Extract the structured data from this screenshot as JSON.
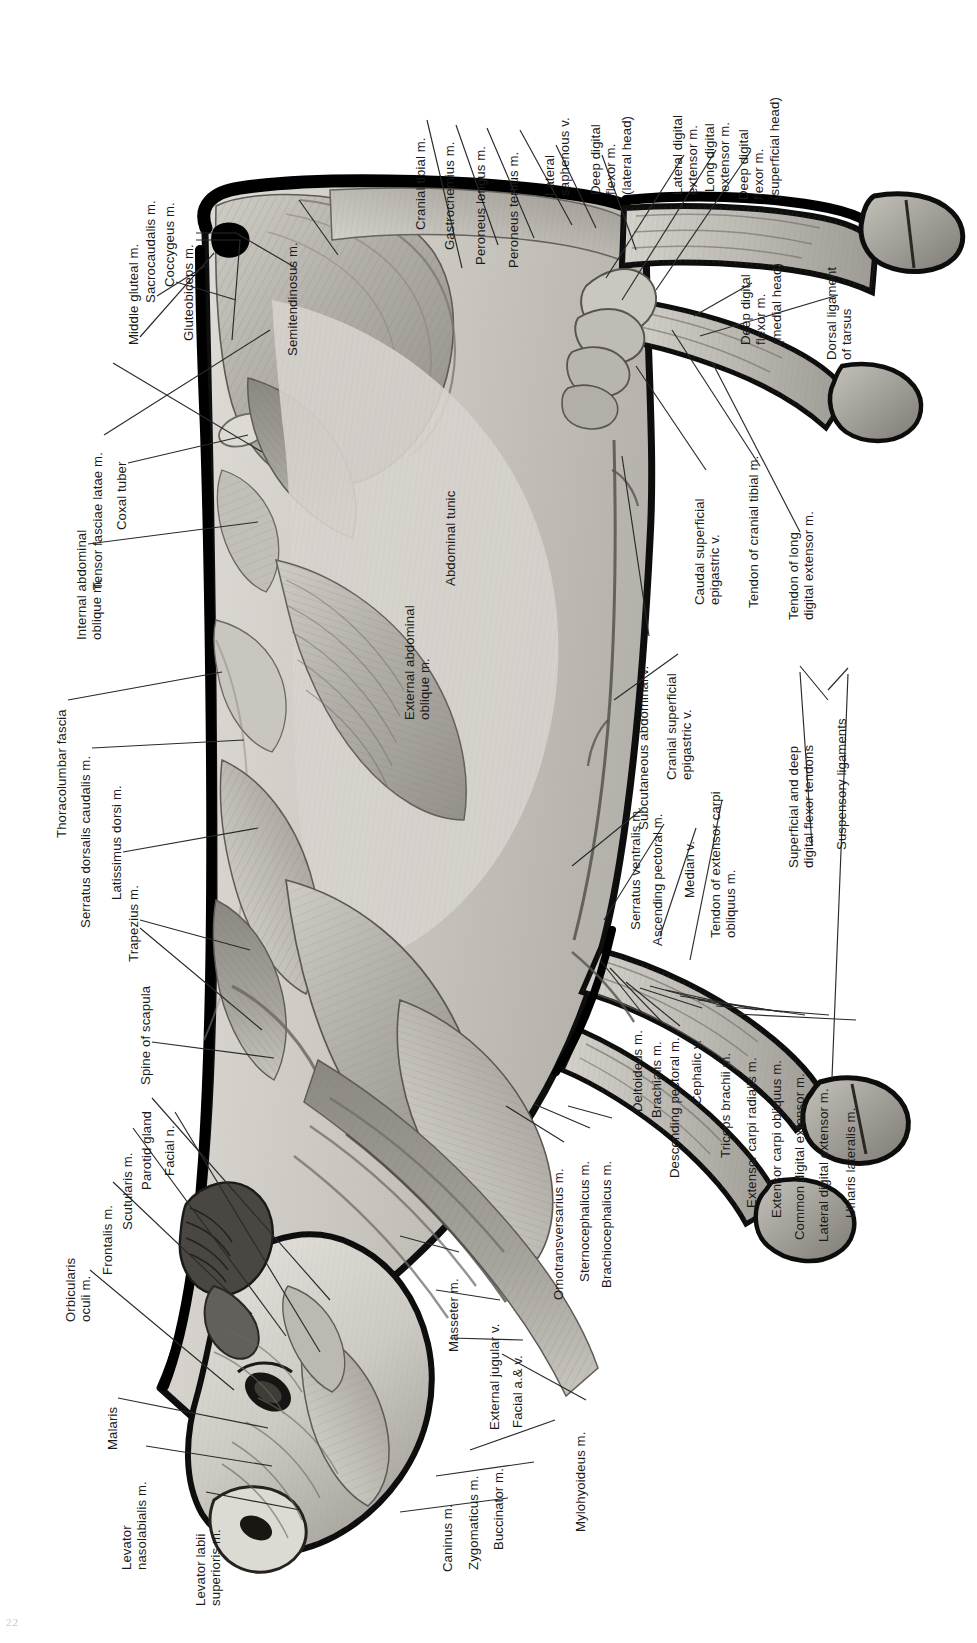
{
  "figure": {
    "orientation": "rotated-90",
    "page_number": "22",
    "palette": {
      "ink": "#1a1a1a",
      "leader": "#2a2a2a",
      "outline": "#0d0d0d",
      "muscle_light": "#d9d6d1",
      "muscle_mid": "#b3afa9",
      "muscle_dark": "#8d8983",
      "muscle_deep": "#6e6a65",
      "paper": "#ffffff"
    }
  },
  "labels": {
    "hindquarter": [
      {
        "id": "middle-gluteal",
        "text": "Middle gluteal m."
      },
      {
        "id": "sacrocaudalis",
        "text": "Sacrocaudalis m."
      },
      {
        "id": "coccygeus",
        "text": "Coccygeus m."
      },
      {
        "id": "gluteobiceps",
        "text": "Gluteobiceps m."
      },
      {
        "id": "semitendinosus",
        "text": "Semitendinosus m."
      },
      {
        "id": "tensor-fasciae-latae",
        "text": "Tensor fasciae latae m."
      },
      {
        "id": "coxal-tuber",
        "text": "Coxal tuber"
      },
      {
        "id": "internal-abdominal-oblique",
        "text": "Internal abdominal\noblique m."
      }
    ],
    "hindlimb": [
      {
        "id": "cranial-tibial",
        "text": "Cranial tibial m."
      },
      {
        "id": "gastrocnemius",
        "text": "Gastrocnemius m."
      },
      {
        "id": "peroneus-longus",
        "text": "Peroneus longus m."
      },
      {
        "id": "peroneus-tertius",
        "text": "Peroneus tertius m."
      },
      {
        "id": "lateral-saphenous-v",
        "text": "Lateral\nsaphenous v."
      },
      {
        "id": "deep-digital-flexor-lateral",
        "text": "Deep digital\nflexor m.\n(lateral head)"
      },
      {
        "id": "lateral-digital-extensor",
        "text": "Lateral digital\nextensor m."
      },
      {
        "id": "long-digital-extensor",
        "text": "Long digital\nextensor m."
      },
      {
        "id": "deep-digital-flexor-superficial",
        "text": "Deep digital\nflexor m.\n(superficial head)"
      },
      {
        "id": "deep-digital-flexor-medial",
        "text": "Deep digital\nflexor m.\n(medial head)"
      },
      {
        "id": "dorsal-ligament-tarsus",
        "text": "Dorsal ligament\nof tarsus"
      },
      {
        "id": "tendon-cranial-tibial",
        "text": "Tendon of cranial tibial m."
      },
      {
        "id": "tendon-long-digital-extensor",
        "text": "Tendon of long\ndigital extensor m."
      }
    ],
    "trunk": [
      {
        "id": "thoracolumbar-fascia",
        "text": "Thoracolumbar fascia"
      },
      {
        "id": "serratus-dorsalis-caudalis",
        "text": "Serratus dorsalis caudalis m."
      },
      {
        "id": "latissimus-dorsi",
        "text": "Latissimus dorsi m."
      },
      {
        "id": "trapezius",
        "text": "Trapezius m."
      },
      {
        "id": "spine-of-scapula",
        "text": "Spine of scapula"
      },
      {
        "id": "abdominal-tunic",
        "text": "Abdominal tunic"
      },
      {
        "id": "external-abdominal-oblique",
        "text": "External abdominal\noblique m."
      }
    ],
    "ventral": [
      {
        "id": "subcutaneous-abdominal-v",
        "text": "Subcutaneous abdominal v."
      },
      {
        "id": "cranial-superficial-epigastric-v",
        "text": "Cranial superficial\nepigastric v."
      },
      {
        "id": "caudal-superficial-epigastric-v",
        "text": "Caudal superficial\nepigastric v."
      },
      {
        "id": "serratus-ventralis",
        "text": "Serratus ventralis m."
      },
      {
        "id": "ascending-pectoral",
        "text": "Ascending pectoral m."
      },
      {
        "id": "median-v",
        "text": "Median v."
      },
      {
        "id": "tendon-extensor-carpi-obliquus",
        "text": "Tendon of extensor carpi\nobliquus m."
      },
      {
        "id": "superficial-deep-digital-flexor-tendons",
        "text": "Superficial and deep\ndigital flexor tendons"
      },
      {
        "id": "suspensory-ligaments",
        "text": "Suspensory ligaments"
      }
    ],
    "forelimb": [
      {
        "id": "deltoideus",
        "text": "Deltoideus m."
      },
      {
        "id": "brachialis",
        "text": "Brachialis m."
      },
      {
        "id": "descending-pectoral",
        "text": "Descending pectoral m."
      },
      {
        "id": "cephalic-v",
        "text": "Cephalic v."
      },
      {
        "id": "triceps-brachii",
        "text": "Triceps brachii m."
      },
      {
        "id": "extensor-carpi-radialis",
        "text": "Extensor carpi radialis m."
      },
      {
        "id": "extensor-carpi-obliquus",
        "text": "Extensor carpi obliquus m."
      },
      {
        "id": "common-digital-extensor",
        "text": "Common digital extensor m."
      },
      {
        "id": "lateral-digital-extensor-fore",
        "text": "Lateral digital extensor m."
      },
      {
        "id": "ulnaris-lateralis",
        "text": "Ulnaris lateralis m."
      }
    ],
    "neck": [
      {
        "id": "brachiocephalicus",
        "text": "Brachiocephalicus m."
      },
      {
        "id": "sternocephalicus",
        "text": "Sternocephalicus m."
      },
      {
        "id": "omotransversarius",
        "text": "Omotransversarius m."
      },
      {
        "id": "mylohyoideus",
        "text": "Mylohyoideus m."
      },
      {
        "id": "facial-a-v",
        "text": "Facial a.& v."
      },
      {
        "id": "external-jugular-v",
        "text": "External jugular v."
      },
      {
        "id": "masseter",
        "text": "Masseter m."
      }
    ],
    "head": [
      {
        "id": "parotid-gland",
        "text": "Parotid gland"
      },
      {
        "id": "facial-n",
        "text": "Facial n."
      },
      {
        "id": "scutularis",
        "text": "Scutularis m."
      },
      {
        "id": "frontalis",
        "text": "Frontalis m."
      },
      {
        "id": "orbicularis-oculi",
        "text": "Orbicularis\noculi m."
      },
      {
        "id": "malaris",
        "text": "Malaris"
      },
      {
        "id": "levator-nasolabialis",
        "text": "Levator\nnasolabialis m."
      },
      {
        "id": "levator-labii-superioris",
        "text": "Levator labii\nsuperioris m."
      },
      {
        "id": "caninus",
        "text": "Caninus m."
      },
      {
        "id": "zygomaticus",
        "text": "Zygomaticus m."
      },
      {
        "id": "buccinator",
        "text": "Buccinator m."
      }
    ]
  }
}
